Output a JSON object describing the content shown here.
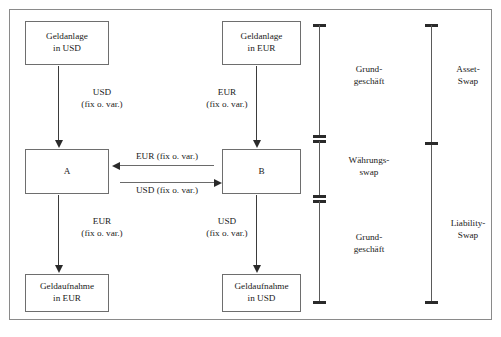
{
  "figure": {
    "caption": ""
  },
  "boxes": {
    "top_left": {
      "line1": "Geldanlage",
      "line2": "in USD"
    },
    "top_right": {
      "line1": "Geldanlage",
      "line2": "in EUR"
    },
    "mid_left": {
      "line1": "A",
      "line2": ""
    },
    "mid_right": {
      "line1": "B",
      "line2": ""
    },
    "bottom_left": {
      "line1": "Geldaufnahme",
      "line2": "in EUR"
    },
    "bottom_right": {
      "line1": "Geldaufnahme",
      "line2": "in USD"
    }
  },
  "flows": {
    "top_left_down": {
      "currency": "USD",
      "terms": "(fix o. var.)"
    },
    "top_right_down": {
      "currency": "EUR",
      "terms": "(fix o. var.)"
    },
    "bottom_left_down": {
      "currency": "EUR",
      "terms": "(fix o. var.)"
    },
    "bottom_right_down": {
      "currency": "USD",
      "terms": "(fix o. var.)"
    },
    "swap_b_to_a": {
      "label": "EUR (fix o. var.)"
    },
    "swap_a_to_b": {
      "label": "USD (fix o. var.)"
    }
  },
  "brackets": {
    "inner": [
      {
        "line1": "Grund-",
        "line2": "geschäft"
      },
      {
        "line1": "Währungs-",
        "line2": "swap"
      },
      {
        "line1": "Grund-",
        "line2": "geschäft"
      }
    ],
    "outer": [
      {
        "line1": "Asset-",
        "line2": "Swap"
      },
      {
        "line1": "Liability-",
        "line2": "Swap"
      }
    ]
  },
  "colors": {
    "frame": "#8a8a8a",
    "box_border": "#6e6e6e",
    "arrow": "#2a2a2a",
    "text": "#1a1a1a",
    "background": "#ffffff"
  }
}
